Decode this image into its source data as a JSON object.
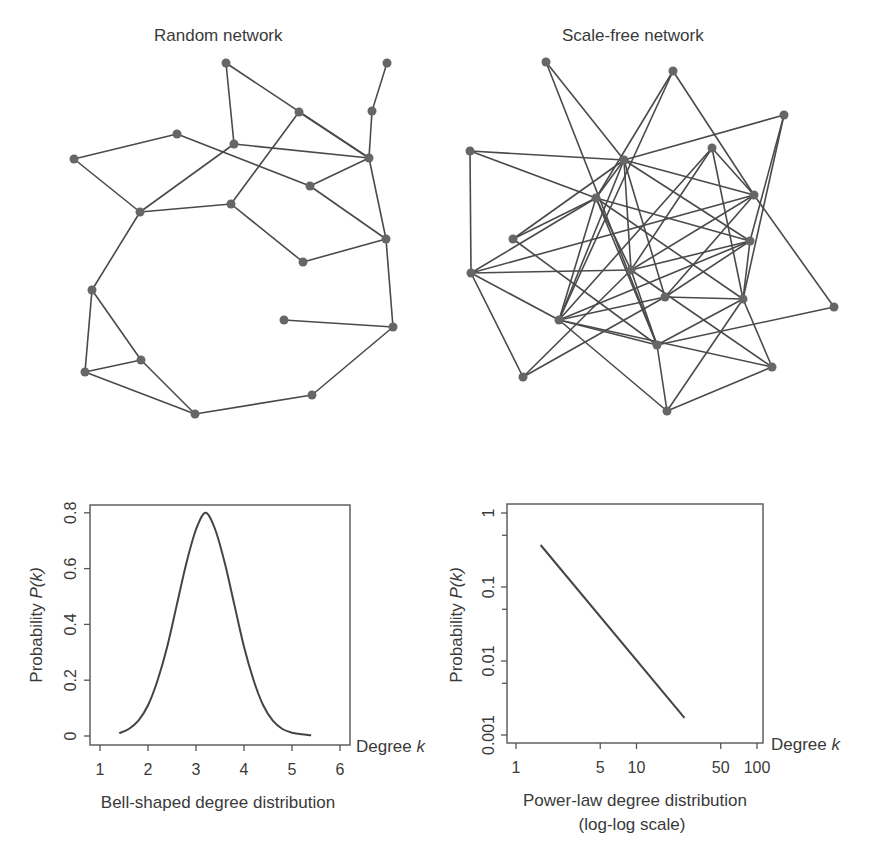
{
  "panels": {
    "random": {
      "title": "Random network"
    },
    "scalefree": {
      "title": "Scale-free network"
    }
  },
  "networks": {
    "random": {
      "node_color": "#666666",
      "edge_color": "#4a4a4a",
      "nodes": [
        {
          "id": 0,
          "x": 226,
          "y": 63
        },
        {
          "id": 1,
          "x": 387,
          "y": 63
        },
        {
          "id": 2,
          "x": 372,
          "y": 111
        },
        {
          "id": 3,
          "x": 299,
          "y": 112
        },
        {
          "id": 4,
          "x": 177,
          "y": 134
        },
        {
          "id": 5,
          "x": 234,
          "y": 144
        },
        {
          "id": 6,
          "x": 74,
          "y": 159
        },
        {
          "id": 7,
          "x": 369,
          "y": 158
        },
        {
          "id": 8,
          "x": 310,
          "y": 186
        },
        {
          "id": 9,
          "x": 140,
          "y": 212
        },
        {
          "id": 10,
          "x": 231,
          "y": 204
        },
        {
          "id": 11,
          "x": 386,
          "y": 239
        },
        {
          "id": 12,
          "x": 303,
          "y": 262
        },
        {
          "id": 13,
          "x": 92,
          "y": 290
        },
        {
          "id": 14,
          "x": 284,
          "y": 320
        },
        {
          "id": 15,
          "x": 393,
          "y": 327
        },
        {
          "id": 16,
          "x": 141,
          "y": 360
        },
        {
          "id": 17,
          "x": 85,
          "y": 372
        },
        {
          "id": 18,
          "x": 312,
          "y": 395
        },
        {
          "id": 19,
          "x": 195,
          "y": 414
        }
      ],
      "edges": [
        [
          0,
          5
        ],
        [
          0,
          7
        ],
        [
          1,
          2
        ],
        [
          2,
          7
        ],
        [
          3,
          7
        ],
        [
          3,
          10
        ],
        [
          4,
          6
        ],
        [
          4,
          8
        ],
        [
          5,
          7
        ],
        [
          5,
          9
        ],
        [
          6,
          9
        ],
        [
          7,
          8
        ],
        [
          7,
          11
        ],
        [
          8,
          11
        ],
        [
          9,
          10
        ],
        [
          9,
          13
        ],
        [
          10,
          12
        ],
        [
          11,
          12
        ],
        [
          11,
          15
        ],
        [
          13,
          16
        ],
        [
          13,
          17
        ],
        [
          16,
          17
        ],
        [
          16,
          19
        ],
        [
          17,
          19
        ],
        [
          19,
          18
        ],
        [
          18,
          15
        ],
        [
          14,
          15
        ]
      ]
    },
    "scalefree": {
      "node_color": "#666666",
      "edge_color": "#4a4a4a",
      "nodes": [
        {
          "id": 0,
          "x": 546,
          "y": 62
        },
        {
          "id": 1,
          "x": 673,
          "y": 71
        },
        {
          "id": 2,
          "x": 784,
          "y": 115
        },
        {
          "id": 3,
          "x": 470,
          "y": 151
        },
        {
          "id": 4,
          "x": 712,
          "y": 148
        },
        {
          "id": 5,
          "x": 624,
          "y": 160
        },
        {
          "id": 6,
          "x": 596,
          "y": 198
        },
        {
          "id": 7,
          "x": 754,
          "y": 195
        },
        {
          "id": 8,
          "x": 513,
          "y": 239
        },
        {
          "id": 9,
          "x": 750,
          "y": 241
        },
        {
          "id": 10,
          "x": 631,
          "y": 270
        },
        {
          "id": 11,
          "x": 471,
          "y": 273
        },
        {
          "id": 12,
          "x": 665,
          "y": 297
        },
        {
          "id": 13,
          "x": 743,
          "y": 299
        },
        {
          "id": 14,
          "x": 834,
          "y": 307
        },
        {
          "id": 15,
          "x": 559,
          "y": 320
        },
        {
          "id": 16,
          "x": 657,
          "y": 345
        },
        {
          "id": 17,
          "x": 523,
          "y": 377
        },
        {
          "id": 18,
          "x": 772,
          "y": 367
        },
        {
          "id": 19,
          "x": 667,
          "y": 411
        }
      ],
      "edges": [
        [
          0,
          5
        ],
        [
          0,
          16
        ],
        [
          1,
          6
        ],
        [
          1,
          7
        ],
        [
          1,
          15
        ],
        [
          2,
          5
        ],
        [
          2,
          9
        ],
        [
          2,
          13
        ],
        [
          3,
          5
        ],
        [
          3,
          6
        ],
        [
          3,
          11
        ],
        [
          4,
          7
        ],
        [
          4,
          10
        ],
        [
          4,
          15
        ],
        [
          4,
          13
        ],
        [
          5,
          6
        ],
        [
          5,
          7
        ],
        [
          5,
          9
        ],
        [
          5,
          15
        ],
        [
          5,
          10
        ],
        [
          5,
          12
        ],
        [
          5,
          8
        ],
        [
          6,
          8
        ],
        [
          6,
          11
        ],
        [
          6,
          15
        ],
        [
          6,
          16
        ],
        [
          6,
          10
        ],
        [
          6,
          13
        ],
        [
          6,
          9
        ],
        [
          7,
          10
        ],
        [
          7,
          12
        ],
        [
          7,
          14
        ],
        [
          7,
          11
        ],
        [
          8,
          16
        ],
        [
          9,
          10
        ],
        [
          9,
          15
        ],
        [
          9,
          13
        ],
        [
          9,
          12
        ],
        [
          10,
          11
        ],
        [
          10,
          17
        ],
        [
          10,
          16
        ],
        [
          10,
          18
        ],
        [
          11,
          15
        ],
        [
          11,
          17
        ],
        [
          12,
          13
        ],
        [
          12,
          15
        ],
        [
          12,
          17
        ],
        [
          13,
          16
        ],
        [
          13,
          19
        ],
        [
          13,
          18
        ],
        [
          14,
          16
        ],
        [
          15,
          19
        ],
        [
          15,
          16
        ],
        [
          15,
          18
        ],
        [
          18,
          19
        ],
        [
          16,
          19
        ]
      ]
    }
  },
  "chart_data": [
    {
      "type": "line",
      "title": "",
      "caption": "Bell-shaped degree distribution",
      "xlabel": "Degree",
      "xlabel_var": "k",
      "ylabel": "Probability",
      "ylabel_var": "P(k)",
      "xlim": [
        1,
        6
      ],
      "ylim": [
        0,
        0.8
      ],
      "xticks": [
        "1",
        "2",
        "3",
        "4",
        "5",
        "6"
      ],
      "yticks": [
        "0",
        "0.2",
        "0.4",
        "0.6",
        "0.8"
      ],
      "grid": false,
      "series": [
        {
          "name": "P(k)",
          "x": [
            1.4,
            1.6,
            1.8,
            2.0,
            2.2,
            2.4,
            2.6,
            2.8,
            3.0,
            3.2,
            3.4,
            3.6,
            3.8,
            4.0,
            4.2,
            4.4,
            4.6,
            4.8,
            5.0,
            5.2,
            5.4
          ],
          "y": [
            0.01,
            0.025,
            0.055,
            0.11,
            0.2,
            0.32,
            0.47,
            0.62,
            0.74,
            0.8,
            0.74,
            0.62,
            0.47,
            0.32,
            0.2,
            0.11,
            0.055,
            0.025,
            0.012,
            0.006,
            0.003
          ]
        }
      ]
    },
    {
      "type": "line",
      "title": "",
      "caption": "Power-law degree distribution",
      "caption2": "(log-log scale)",
      "xlabel": "Degree",
      "xlabel_var": "k",
      "ylabel": "Probability",
      "ylabel_var": "P(k)",
      "xscale": "log",
      "yscale": "log",
      "xlim": [
        1,
        100
      ],
      "ylim": [
        0.001,
        1
      ],
      "xticks": [
        "1",
        "5",
        "10",
        "50",
        "100"
      ],
      "yticks": [
        "0.001",
        "0.01",
        "0.1",
        "1"
      ],
      "grid": false,
      "series": [
        {
          "name": "P(k)",
          "x": [
            1.6,
            25
          ],
          "y": [
            0.37,
            0.0017
          ]
        }
      ]
    }
  ]
}
